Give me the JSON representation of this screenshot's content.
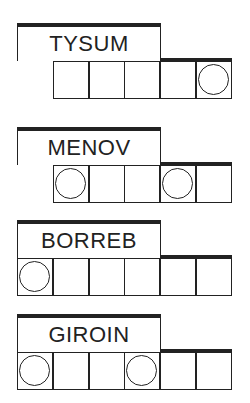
{
  "puzzles": [
    {
      "word": "TYSUM",
      "cells": 6,
      "start_cell": 1,
      "circled": [
        5
      ]
    },
    {
      "word": "MENOV",
      "cells": 6,
      "start_cell": 1,
      "circled": [
        1,
        4
      ]
    },
    {
      "word": "BORREB",
      "cells": 6,
      "start_cell": 0,
      "circled": [
        0
      ]
    },
    {
      "word": "GIROIN",
      "cells": 6,
      "start_cell": 0,
      "circled": [
        0,
        3
      ]
    }
  ],
  "colors": {
    "ink": "#222222",
    "background": "#ffffff"
  }
}
